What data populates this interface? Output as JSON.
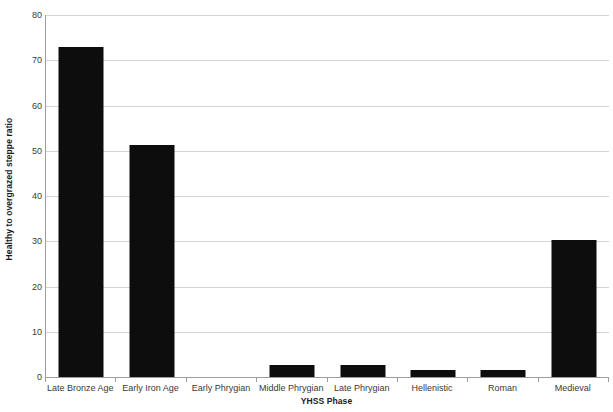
{
  "chart_data": {
    "type": "bar",
    "title": "",
    "xlabel": "YHSS Phase",
    "ylabel": "Healthy to overgrazed steppe ratio",
    "categories": [
      "Late Bronze Age",
      "Early Iron Age",
      "Early Phrygian",
      "Middle Phrygian",
      "Late Phrygian",
      "Hellenistic",
      "Roman",
      "Medieval"
    ],
    "values": [
      73.0,
      51.2,
      0,
      2.7,
      2.7,
      1.5,
      1.5,
      30.3
    ],
    "ylim": [
      0,
      80
    ],
    "ytick_labels": [
      "0",
      "10",
      "20",
      "30",
      "40",
      "50",
      "60",
      "70",
      "80"
    ],
    "ytick_values": [
      0,
      10,
      20,
      30,
      40,
      50,
      60,
      70,
      80
    ],
    "grid": true,
    "legend": "none",
    "bar_color": "#0d0d0d",
    "gridline_color": "#d4d4d4",
    "axis_color": "#9c9c9c",
    "background_color": "#ffffff"
  }
}
